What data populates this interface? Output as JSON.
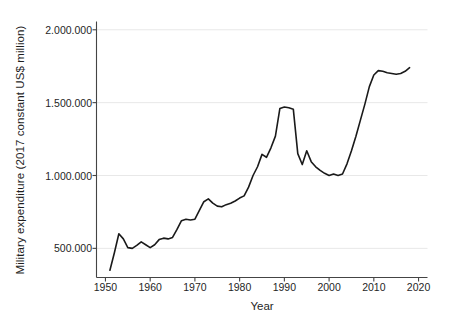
{
  "chart_data": {
    "type": "line",
    "title": "",
    "xlabel": "Year",
    "ylabel": "Military expenditure (2017 constant US$ million)",
    "xlim": [
      1948,
      2022
    ],
    "ylim": [
      300000,
      2050000
    ],
    "grid": true,
    "legend": "none",
    "line_color": "#1a1a1a",
    "grid_color": "#e8e8e8",
    "axis_color": "#444444",
    "background_color": "#ffffff",
    "xticks": [
      1950,
      1960,
      1970,
      1980,
      1990,
      2000,
      2010,
      2020
    ],
    "xtick_labels": [
      "1950",
      "1960",
      "1970",
      "1980",
      "1990",
      "2000",
      "2010",
      "2020"
    ],
    "yticks": [
      500000,
      1000000,
      1500000,
      2000000
    ],
    "ytick_labels": [
      "500.000",
      "1.000.000",
      "1.500.000",
      "2.000.000"
    ],
    "x": [
      1951,
      1952,
      1953,
      1954,
      1955,
      1956,
      1957,
      1958,
      1959,
      1960,
      1961,
      1962,
      1963,
      1964,
      1965,
      1966,
      1967,
      1968,
      1969,
      1970,
      1971,
      1972,
      1973,
      1974,
      1975,
      1976,
      1977,
      1978,
      1979,
      1980,
      1981,
      1982,
      1983,
      1984,
      1985,
      1986,
      1987,
      1988,
      1989,
      1990,
      1991,
      1992,
      1993,
      1994,
      1995,
      1996,
      1997,
      1998,
      1999,
      2000,
      2001,
      2002,
      2003,
      2004,
      2005,
      2006,
      2007,
      2008,
      2009,
      2010,
      2011,
      2012,
      2013,
      2014,
      2015,
      2016,
      2017,
      2018
    ],
    "values": [
      350000,
      470000,
      600000,
      565000,
      505000,
      500000,
      520000,
      545000,
      525000,
      505000,
      525000,
      560000,
      570000,
      565000,
      575000,
      630000,
      690000,
      700000,
      695000,
      700000,
      760000,
      820000,
      840000,
      810000,
      790000,
      785000,
      800000,
      810000,
      825000,
      845000,
      860000,
      920000,
      1000000,
      1060000,
      1145000,
      1125000,
      1190000,
      1270000,
      1460000,
      1470000,
      1465000,
      1455000,
      1150000,
      1075000,
      1170000,
      1095000,
      1060000,
      1035000,
      1015000,
      1000000,
      1010000,
      1000000,
      1010000,
      1080000,
      1170000,
      1270000,
      1380000,
      1490000,
      1610000,
      1690000,
      1720000,
      1715000,
      1705000,
      1700000,
      1695000,
      1700000,
      1715000,
      1740000
    ]
  }
}
